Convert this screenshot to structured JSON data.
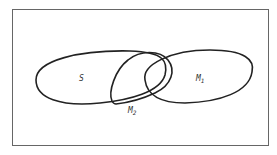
{
  "diagram": {
    "type": "venn",
    "frame": {
      "x": 12,
      "y": 9,
      "width": 257,
      "height": 137,
      "stroke": "#555555"
    },
    "sets": [
      {
        "id": "S",
        "label": "S",
        "subscript": ""
      },
      {
        "id": "M1",
        "label": "M",
        "subscript": "1"
      },
      {
        "id": "M2",
        "label": "M",
        "subscript": "2"
      }
    ],
    "stroke_color": "#222222"
  }
}
